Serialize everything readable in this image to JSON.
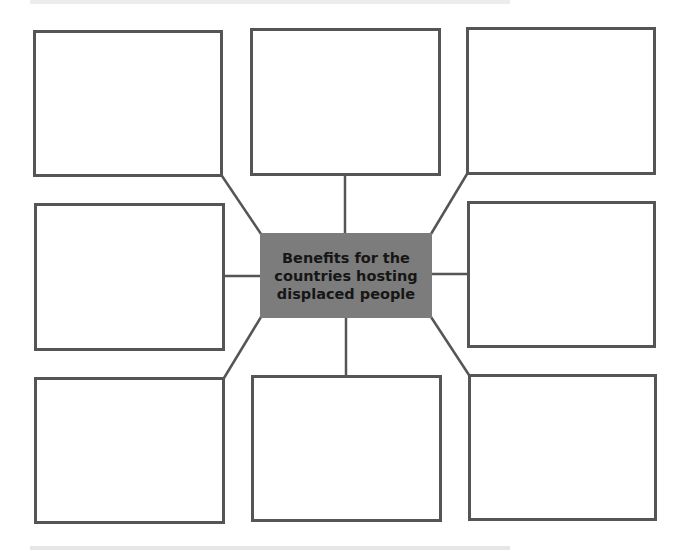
{
  "diagram": {
    "type": "spider-diagram",
    "center": {
      "label": "Benefits for the\ncountries hosting\ndisplaced people",
      "fill": "#7c7c7c",
      "text_color": "#161616"
    },
    "outer_boxes": [
      {
        "id": "top-left",
        "text": ""
      },
      {
        "id": "top-center",
        "text": ""
      },
      {
        "id": "top-right",
        "text": ""
      },
      {
        "id": "middle-left",
        "text": ""
      },
      {
        "id": "middle-right",
        "text": ""
      },
      {
        "id": "bottom-left",
        "text": ""
      },
      {
        "id": "bottom-center",
        "text": ""
      },
      {
        "id": "bottom-right",
        "text": ""
      }
    ],
    "line_color": "#555555"
  }
}
